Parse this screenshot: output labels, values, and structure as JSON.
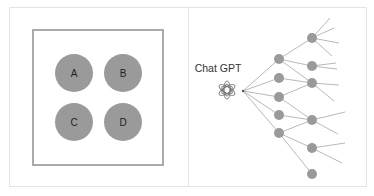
{
  "left_panel": {
    "circles": [
      {
        "label": "A",
        "cx": 74,
        "cy": 73
      },
      {
        "label": "B",
        "cx": 123,
        "cy": 73
      },
      {
        "label": "C",
        "cx": 74,
        "cy": 122
      },
      {
        "label": "D",
        "cx": 123,
        "cy": 122
      }
    ],
    "circle_radius": 19,
    "circle_color": "#9a9a9a",
    "box": {
      "x": 33,
      "y": 30,
      "w": 130,
      "h": 135,
      "stroke": "#aaaaaa"
    }
  },
  "right_panel": {
    "title": "Chat GPT",
    "logo_icon": "openai-logo-icon",
    "hub": {
      "x": 243,
      "y": 91
    },
    "node_color": "#9a9a9a",
    "edge_color": "#b0b0b0"
  }
}
